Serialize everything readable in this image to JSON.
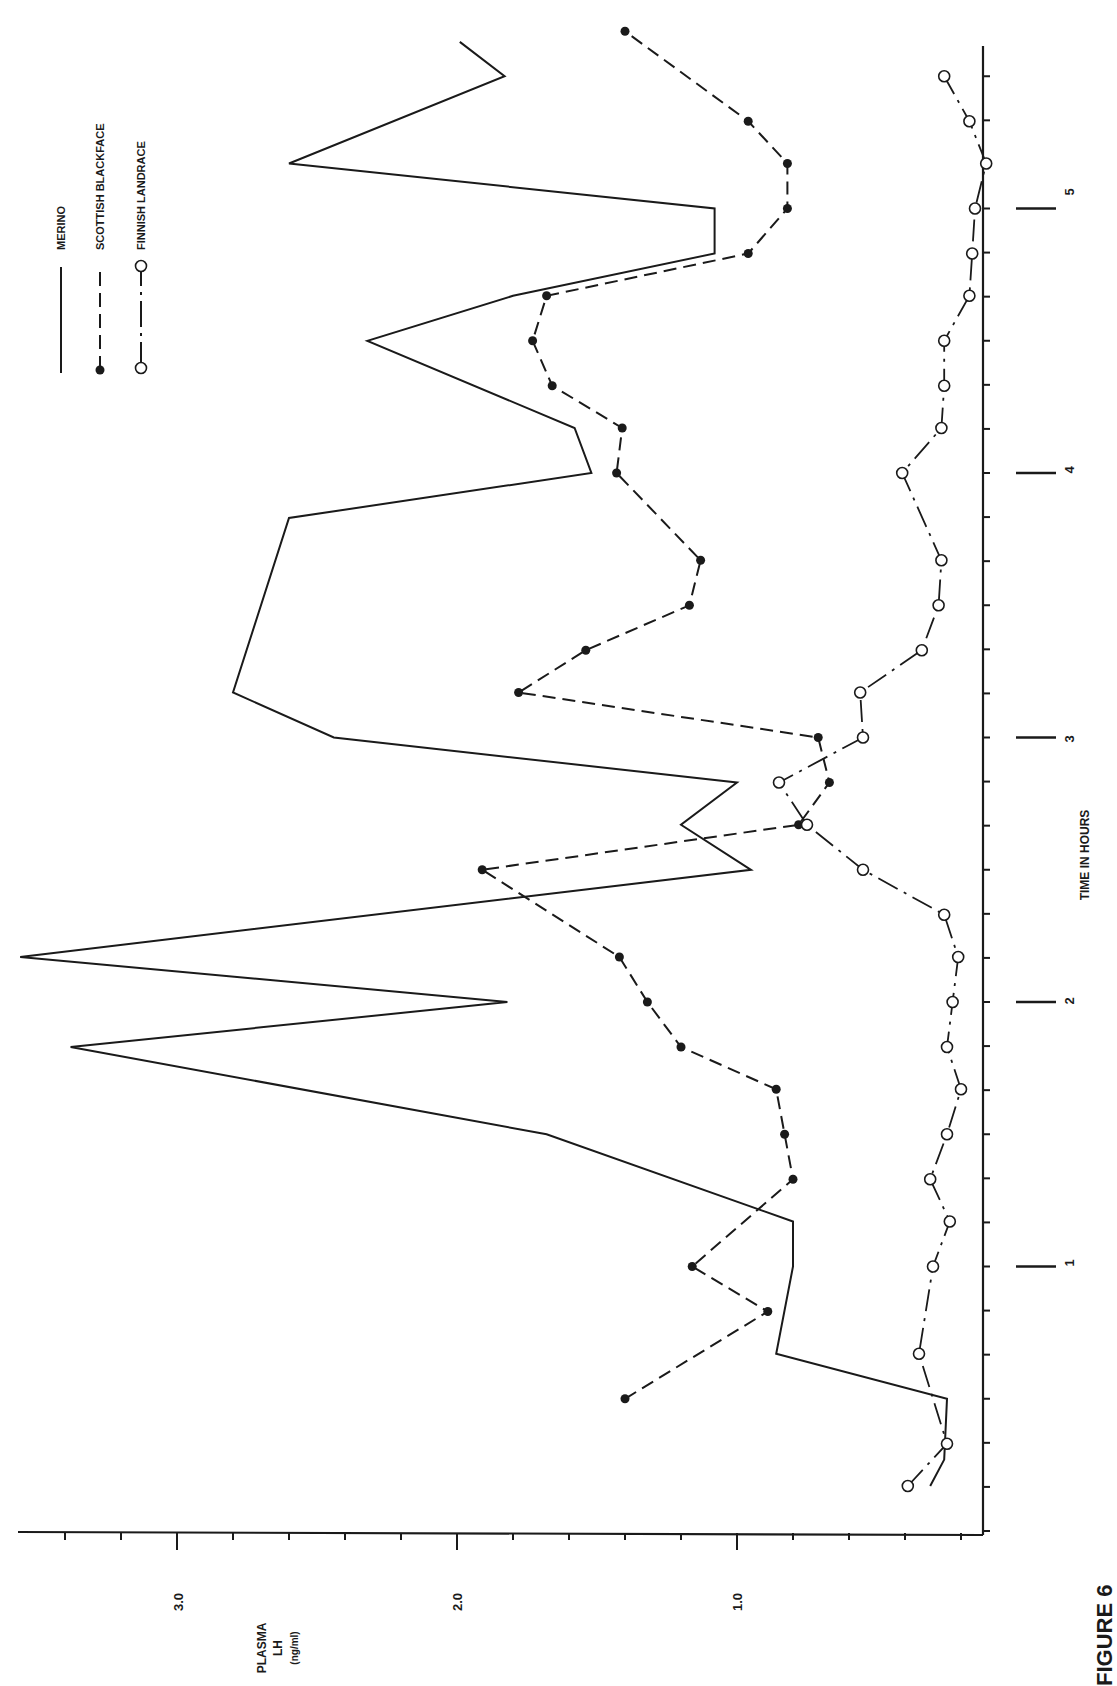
{
  "chart_data": {
    "type": "line",
    "orientation": "rotated-90-ccw",
    "title": "",
    "xlabel": "TIME IN HOURS",
    "ylabel": "PLASMA LH (ng/ml)",
    "ylabel_lines": [
      "PLASMA",
      "LH",
      "(ng/ml)"
    ],
    "x_ticks": [
      "1",
      "2",
      "3",
      "4",
      "5"
    ],
    "x_tick_values": [
      1,
      2,
      3,
      4,
      5
    ],
    "y_ticks": [
      "1.0",
      "2.0",
      "3.0"
    ],
    "y_tick_values": [
      1.0,
      2.0,
      3.0
    ],
    "xlim": [
      0,
      5.5
    ],
    "ylim": [
      0.12,
      3.55
    ],
    "grid": false,
    "legend_position": "top-left (rotated)",
    "x": [
      0.17,
      0.33,
      0.5,
      0.67,
      0.83,
      1.0,
      1.17,
      1.33,
      1.5,
      1.67,
      1.83,
      2.0,
      2.17,
      2.33,
      2.5,
      2.67,
      2.83,
      3.0,
      3.17,
      3.33,
      3.5,
      3.67,
      3.83,
      4.0,
      4.17,
      4.33,
      4.5,
      4.67,
      4.83,
      5.0,
      5.17,
      5.33,
      5.5
    ],
    "series": [
      {
        "name": "MERINO",
        "style": "solid",
        "marker": "none",
        "points": [
          [
            0.17,
            0.31
          ],
          [
            0.27,
            0.26
          ],
          [
            0.5,
            0.25
          ],
          [
            0.67,
            0.86
          ],
          [
            1.0,
            0.8
          ],
          [
            1.17,
            0.8
          ],
          [
            1.5,
            1.68
          ],
          [
            1.83,
            3.38
          ],
          [
            2.0,
            1.82
          ],
          [
            2.17,
            3.56
          ],
          [
            2.5,
            0.95
          ],
          [
            2.67,
            1.2
          ],
          [
            2.83,
            1.0
          ],
          [
            3.0,
            2.44
          ],
          [
            3.17,
            2.8
          ],
          [
            3.83,
            2.6
          ],
          [
            4.0,
            1.52
          ],
          [
            4.17,
            1.58
          ],
          [
            4.5,
            2.32
          ],
          [
            4.67,
            1.8
          ],
          [
            4.83,
            1.08
          ],
          [
            5.0,
            1.08
          ],
          [
            5.17,
            2.6
          ],
          [
            5.5,
            1.83
          ],
          [
            5.63,
            1.99
          ]
        ]
      },
      {
        "name": "SCOTTISH BLACKFACE",
        "style": "dashed",
        "marker": "filled-circle",
        "points": [
          [
            0.5,
            1.4
          ],
          [
            0.83,
            0.89
          ],
          [
            1.0,
            1.16
          ],
          [
            1.33,
            0.8
          ],
          [
            1.5,
            0.83
          ],
          [
            1.67,
            0.86
          ],
          [
            1.83,
            1.2
          ],
          [
            2.0,
            1.32
          ],
          [
            2.17,
            1.42
          ],
          [
            2.5,
            1.91
          ],
          [
            2.67,
            0.78
          ],
          [
            2.83,
            0.67
          ],
          [
            3.0,
            0.71
          ],
          [
            3.17,
            1.78
          ],
          [
            3.33,
            1.54
          ],
          [
            3.5,
            1.17
          ],
          [
            3.67,
            1.13
          ],
          [
            4.0,
            1.43
          ],
          [
            4.17,
            1.41
          ],
          [
            4.33,
            1.66
          ],
          [
            4.5,
            1.73
          ],
          [
            4.67,
            1.68
          ],
          [
            4.83,
            0.96
          ],
          [
            5.0,
            0.82
          ],
          [
            5.17,
            0.82
          ],
          [
            5.33,
            0.96
          ],
          [
            5.67,
            1.4
          ]
        ]
      },
      {
        "name": "FINNISH LANDRACE",
        "style": "dash-dot",
        "marker": "open-circle",
        "points": [
          [
            0.17,
            0.39
          ],
          [
            0.33,
            0.25
          ],
          [
            0.67,
            0.35
          ],
          [
            1.0,
            0.3
          ],
          [
            1.17,
            0.24
          ],
          [
            1.33,
            0.31
          ],
          [
            1.5,
            0.25
          ],
          [
            1.67,
            0.2
          ],
          [
            1.83,
            0.25
          ],
          [
            2.0,
            0.23
          ],
          [
            2.17,
            0.21
          ],
          [
            2.33,
            0.26
          ],
          [
            2.5,
            0.55
          ],
          [
            2.67,
            0.75
          ],
          [
            2.83,
            0.85
          ],
          [
            3.0,
            0.55
          ],
          [
            3.17,
            0.56
          ],
          [
            3.33,
            0.34
          ],
          [
            3.5,
            0.28
          ],
          [
            3.67,
            0.27
          ],
          [
            4.0,
            0.41
          ],
          [
            4.17,
            0.27
          ],
          [
            4.33,
            0.26
          ],
          [
            4.5,
            0.26
          ],
          [
            4.67,
            0.17
          ],
          [
            4.83,
            0.16
          ],
          [
            5.0,
            0.15
          ],
          [
            5.17,
            0.11
          ],
          [
            5.33,
            0.17
          ],
          [
            5.5,
            0.26
          ]
        ]
      }
    ],
    "legend": [
      {
        "label": "MERINO",
        "style": "solid",
        "marker": "none"
      },
      {
        "label": "SCOTTISH BLACKFACE",
        "style": "dashed",
        "marker": "filled-circle"
      },
      {
        "label": "FINNISH LANDRACE",
        "style": "dash-dot",
        "marker": "open-circle"
      }
    ]
  },
  "caption_fragment": "FIGURE 6"
}
